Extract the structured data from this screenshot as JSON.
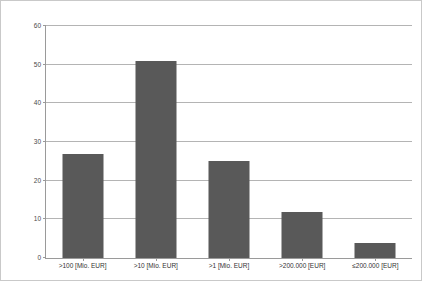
{
  "chart_data": {
    "type": "bar",
    "title": "",
    "subtitle": "",
    "xlabel": "",
    "ylabel": "",
    "categories": [
      ">100 [Mio. EUR]",
      ">10 [Mio. EUR]",
      ">1 [Mio. EUR]",
      ">200.000 [EUR]",
      "≤200.000 [EUR]"
    ],
    "values": [
      27,
      51,
      25,
      12,
      4
    ],
    "ylim": [
      0,
      60
    ],
    "yticks": [
      0,
      10,
      20,
      30,
      40,
      50,
      60
    ],
    "ytick_labels": [
      "0",
      "10",
      "20",
      "30",
      "40",
      "50",
      "60"
    ],
    "grid": true,
    "grid_axis": "y",
    "legend": false,
    "legend_position": "none",
    "bar_color": "#595959",
    "gridline_color": "#b4b4b4",
    "axis_color": "#9a9a9a",
    "frame_color": "#c9c9c9",
    "background_color": "#ffffff"
  }
}
